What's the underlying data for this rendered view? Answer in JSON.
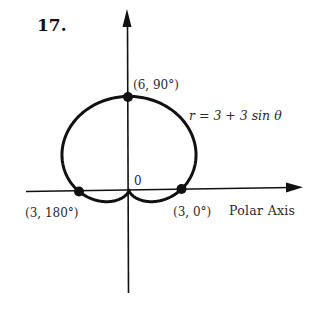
{
  "figure": {
    "problem_number": "17.",
    "origin_label": "0",
    "equation_label": "r = 3 + 3 sin θ",
    "polar_axis_label": "Polar Axis",
    "colors": {
      "curve": "#111111",
      "axis": "#111111",
      "text": "#2a2a2a",
      "background": "#ffffff"
    },
    "points": [
      {
        "label": "(6, 90°)",
        "r": 6,
        "theta_deg": 90
      },
      {
        "label": "(3, 180°)",
        "r": 3,
        "theta_deg": 180
      },
      {
        "label": "(3, 0°)",
        "r": 3,
        "theta_deg": 0
      }
    ]
  },
  "chart_data": {
    "type": "line",
    "coordinate_system": "polar",
    "title": "17.",
    "equation": "r = 3 + 3 sin θ",
    "curve": "cardioid",
    "params": {
      "a": 3,
      "b": 3
    },
    "xlabel": "Polar Axis",
    "ylabel": "",
    "origin_label": "0",
    "annotated_points": [
      {
        "label": "(6, 90°)",
        "r": 6,
        "theta_deg": 90
      },
      {
        "label": "(3, 180°)",
        "r": 3,
        "theta_deg": 180
      },
      {
        "label": "(3, 0°)",
        "r": 3,
        "theta_deg": 0
      }
    ],
    "grid": false,
    "legend": null
  }
}
